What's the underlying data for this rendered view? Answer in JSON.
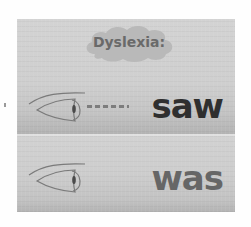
{
  "title": {
    "label": "Dyslexia:",
    "cloud_color": "#b9b9b9",
    "text_color": "#6a6a6a"
  },
  "rows": [
    {
      "icon": "eye-icon",
      "connector": "-----",
      "word": "saw",
      "word_color": "#2f2f2f"
    },
    {
      "icon": "eye-icon",
      "connector": "",
      "word": "was",
      "word_color": "#666666"
    }
  ],
  "colors": {
    "panel_background": "#cecece",
    "page_background": "#fefefe",
    "divider": "#e0e0e0",
    "eye_stroke": "#7a7a7a"
  }
}
